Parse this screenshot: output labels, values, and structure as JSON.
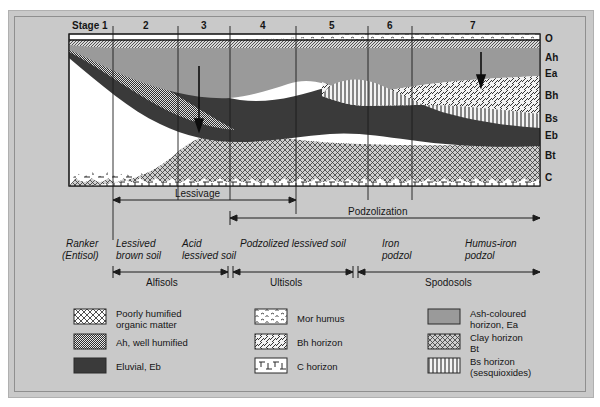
{
  "figure": {
    "stage_axis_label": "Stage 1",
    "stages": [
      "Stage 1",
      "2",
      "3",
      "4",
      "5",
      "6",
      "7"
    ],
    "horizon_labels": [
      "O",
      "Ah",
      "Ea",
      "Bh",
      "Bs",
      "Eb",
      "Bt",
      "C"
    ],
    "process_brackets": [
      {
        "label": "Lessivage"
      },
      {
        "label": "Podzolization"
      }
    ],
    "soil_names": [
      {
        "line1": "Ranker",
        "line2": "(Entisol)"
      },
      {
        "line1": "Lessived",
        "line2": "brown soil"
      },
      {
        "line1": "Acid",
        "line2": "lessived soil"
      },
      {
        "line1": "Podzolized lessived soil",
        "line2": ""
      },
      {
        "line1": "Iron",
        "line2": "podzol"
      },
      {
        "line1": "Humus-iron",
        "line2": "podzol"
      }
    ],
    "soil_orders": [
      "Alfisols",
      "Ultisols",
      "Spodosols"
    ],
    "legend": {
      "column1": [
        {
          "swatch": "poorly-humified-pattern",
          "line1": "Poorly humified",
          "line2": "organic matter"
        },
        {
          "swatch": "ah-well-humified-pattern",
          "line1": "Ah, well humified",
          "line2": ""
        },
        {
          "swatch": "eluvial-solid",
          "line1": "Eluvial, Eb",
          "line2": ""
        }
      ],
      "column2": [
        {
          "swatch": "mor-humus-pattern",
          "line1": "Mor humus",
          "line2": ""
        },
        {
          "swatch": "bh-horizon-pattern",
          "line1": "Bh horizon",
          "line2": ""
        },
        {
          "swatch": "c-horizon-pattern",
          "line1": "C horizon",
          "line2": ""
        }
      ],
      "column3": [
        {
          "swatch": "ash-coloured-solid",
          "line1": "Ash-coloured",
          "line2": "horizon, Ea"
        },
        {
          "swatch": "clay-horizon-pattern",
          "line1": "Clay horizon",
          "line2": "Bt"
        },
        {
          "swatch": "bs-horizon-pattern",
          "line1": "Bs horizon",
          "line2": "(sesquioxides)"
        }
      ]
    },
    "colors": {
      "plate_background": "#c9c9c9",
      "profile_background": "#ffffff",
      "eluvial_dark": "#3a3a3a",
      "ash_grey": "#9a9a9a",
      "outline": "#1a1a1a"
    }
  }
}
